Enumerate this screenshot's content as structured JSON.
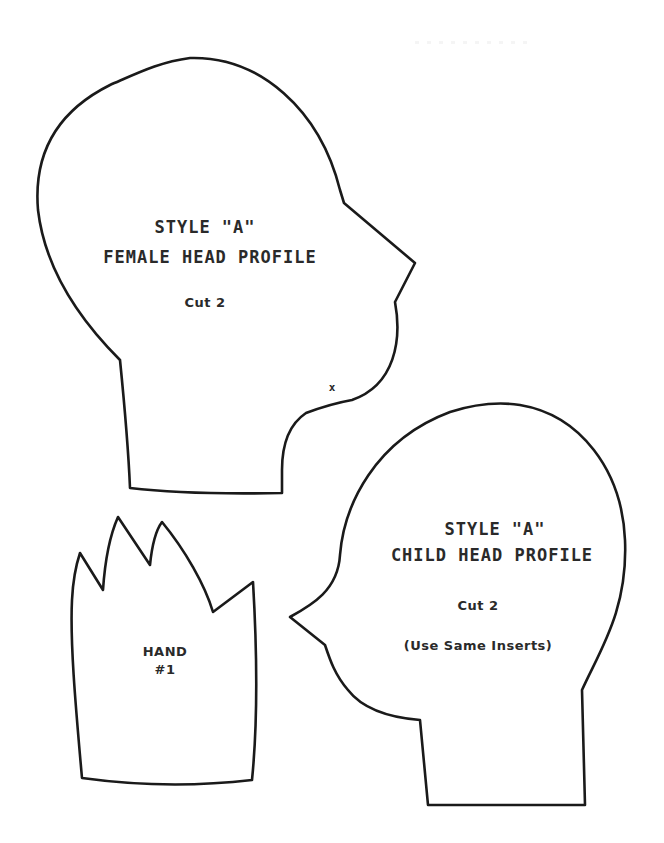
{
  "document": {
    "type": "sewing pattern sheet",
    "background": "#ffffff",
    "stroke_color": "#1a1a1a"
  },
  "pieces": {
    "female_head": {
      "title_line1": "STYLE \"A\"",
      "title_line2": "FEMALE HEAD PROFILE",
      "instruction": "Cut 2",
      "marker": "x"
    },
    "child_head": {
      "title_line1": "STYLE \"A\"",
      "title_line2": "CHILD HEAD PROFILE",
      "instruction": "Cut 2",
      "note": "(Use Same Inserts)"
    },
    "hand": {
      "title_line1": "HAND",
      "title_line2": "#1"
    }
  }
}
